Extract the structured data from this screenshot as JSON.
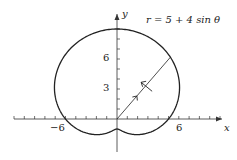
{
  "chart_data": {
    "type": "line",
    "title": "r = 5 + 4 sin θ",
    "equation": "r = 5 + 4\\sin\\theta",
    "xlabel": "x",
    "ylabel": "y",
    "xticks_labeled": [
      -6,
      6
    ],
    "yticks_labeled": [
      3,
      6
    ],
    "xlim": [
      -10,
      10
    ],
    "ylim": [
      -3,
      10
    ],
    "grid": false,
    "curve": "limacon r = 5 + 4 sin(theta), theta in [0, 2π]",
    "annotations": [
      "radial segment from origin at θ≈50° with outward arrow",
      "direction arrow indicating counterclockwise traversal"
    ]
  },
  "labels": {
    "title": "r = 5 + 4 sin θ",
    "x_axis": "x",
    "y_axis": "y",
    "x_neg6": "−6",
    "x_6": "6",
    "y_3": "3",
    "y_6": "6"
  }
}
